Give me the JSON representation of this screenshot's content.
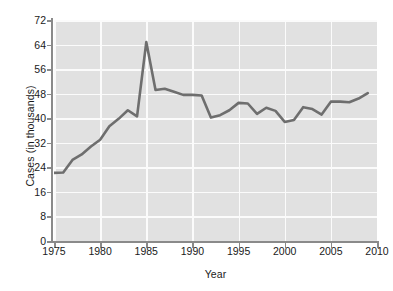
{
  "chart_data": {
    "type": "line",
    "title": "",
    "xlabel": "Year",
    "ylabel": "Cases (in thousands)",
    "xlim": [
      1975,
      2010
    ],
    "ylim": [
      0,
      72
    ],
    "xticks": [
      1975,
      1980,
      1985,
      1990,
      1995,
      2000,
      2005,
      2010
    ],
    "yticks": [
      0,
      8,
      16,
      24,
      32,
      40,
      48,
      56,
      64,
      72
    ],
    "grid": true,
    "legend": "none",
    "line_color": "#6e6e6e",
    "plot_background": "#e1e1e1",
    "gridline_color": "#fbfbfb",
    "series": [
      {
        "name": "Cases",
        "x": [
          1975,
          1976,
          1977,
          1978,
          1979,
          1980,
          1981,
          1982,
          1983,
          1984,
          1985,
          1986,
          1987,
          1988,
          1989,
          1990,
          1991,
          1992,
          1993,
          1994,
          1995,
          1996,
          1997,
          1998,
          1999,
          2000,
          2001,
          2002,
          2003,
          2004,
          2005,
          2006,
          2007,
          2008,
          2009
        ],
        "values": [
          22.2,
          22.3,
          26.4,
          28.2,
          30.8,
          33.0,
          37.4,
          39.8,
          42.6,
          40.6,
          64.8,
          49.2,
          49.6,
          48.6,
          47.6,
          47.6,
          47.4,
          40.2,
          41.0,
          42.6,
          45.0,
          44.8,
          41.4,
          43.4,
          42.4,
          38.8,
          39.4,
          43.6,
          43.0,
          41.2,
          45.4,
          45.4,
          45.2,
          46.4,
          48.2
        ]
      }
    ]
  },
  "axis": {
    "y_tick_labels": [
      "72",
      "64",
      "56",
      "48",
      "40",
      "32",
      "24",
      "16",
      "8",
      "0"
    ],
    "x_tick_labels": [
      "1975",
      "1980",
      "1985",
      "1990",
      "1995",
      "2000",
      "2005",
      "2010"
    ],
    "y_title": "Cases (in thousands)",
    "x_title": "Year"
  }
}
